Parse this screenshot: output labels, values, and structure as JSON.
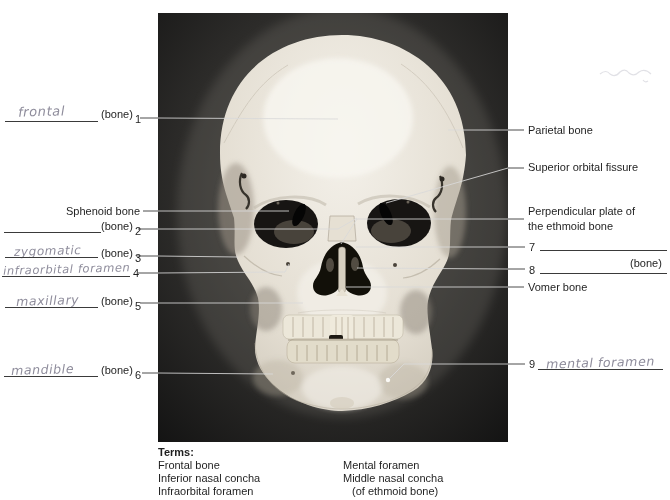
{
  "worksheet": {
    "left": {
      "l1": {
        "handwritten": "frontal",
        "bone": "(bone)",
        "num": "1"
      },
      "sphenoid": {
        "label": "Sphenoid bone"
      },
      "l2": {
        "handwritten": "",
        "bone": "(bone)",
        "num": "2"
      },
      "l3": {
        "handwritten": "zygomatic",
        "bone": "(bone)",
        "num": "3"
      },
      "l4": {
        "handwritten": "infraorbital foramen",
        "num": "4"
      },
      "l5": {
        "handwritten": "maxillary",
        "bone": "(bone)",
        "num": "5"
      },
      "l6": {
        "handwritten": "mandible",
        "bone": "(bone)",
        "num": "6"
      }
    },
    "right": {
      "parietal": "Parietal bone",
      "sof": "Superior orbital fissure",
      "perp1": "Perpendicular plate of",
      "perp2": "the ethmoid bone",
      "n7": "7",
      "bone8": "(bone)",
      "n8": "8",
      "vomer": "Vomer bone",
      "n9": "9",
      "hw9": "mental foramen"
    },
    "terms": {
      "heading": "Terms:",
      "col1": [
        "Frontal bone",
        "Inferior nasal concha",
        "Infraorbital foramen"
      ],
      "col2": [
        "Mental foramen",
        "Middle nasal concha",
        "(of ethmoid bone)"
      ]
    },
    "pencil_note": "illegible faint pencil mark"
  }
}
